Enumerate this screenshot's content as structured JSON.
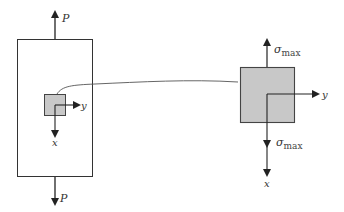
{
  "diagram": {
    "left_member": {
      "load_top_label": "P",
      "load_bottom_label": "P",
      "axis_x_label": "x",
      "axis_y_label": "y"
    },
    "stress_element": {
      "stress_top_symbol": "σ",
      "stress_top_subscript": "max",
      "stress_bottom_symbol": "σ",
      "stress_bottom_subscript": "max",
      "axis_x_label": "x",
      "axis_y_label": "y"
    },
    "colors": {
      "line": "#333333",
      "element_fill": "#c8c8c8",
      "background": "#ffffff"
    }
  }
}
